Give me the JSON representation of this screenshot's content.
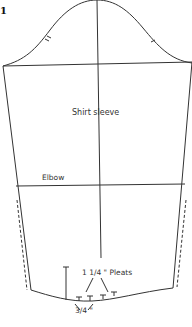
{
  "figure": {
    "number": "1",
    "title": "Shirt sleeve",
    "labels": {
      "elbow": "Elbow",
      "pleats": "1 1/4 \" Pleats",
      "pleat_spacing": "3/4 \""
    },
    "colors": {
      "line": "#333333",
      "background": "#ffffff"
    }
  }
}
